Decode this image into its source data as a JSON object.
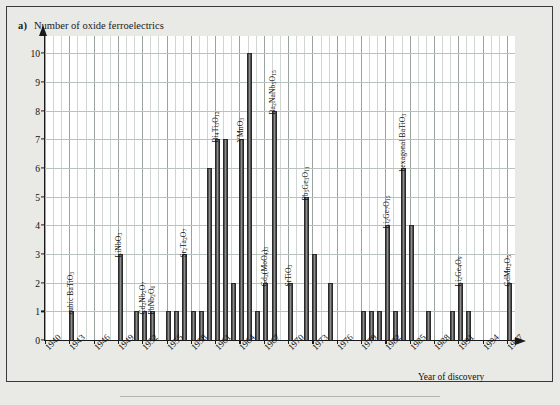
{
  "figure": {
    "panel_label": "a)",
    "y_axis_title": "Number of oxide ferroelectrics",
    "x_axis_title": "Year of discovery",
    "background_color": "#e9e9e5",
    "plot_background_color": "#ffffff",
    "bar_color": "#5a5a5a",
    "grid_color": "#cfd6d2"
  },
  "chart_data": {
    "type": "bar",
    "title": "Number of oxide ferroelectrics",
    "xlabel": "Year of discovery",
    "ylabel": "Number of oxide ferroelectrics",
    "xlim": [
      1940,
      1998
    ],
    "ylim": [
      0,
      10.6
    ],
    "yticks": [
      0,
      1,
      2,
      3,
      4,
      5,
      6,
      7,
      8,
      9,
      10
    ],
    "xticks": [
      1940,
      1943,
      1946,
      1949,
      1952,
      1955,
      1958,
      1961,
      1964,
      1967,
      1970,
      1973,
      1976,
      1979,
      1982,
      1985,
      1988,
      1991,
      1994,
      1997
    ],
    "xtick_labels": [
      "1940",
      "1943",
      "1946",
      "1949",
      "1952",
      "1955",
      "1958",
      "1961",
      "1964",
      "1967",
      "1970",
      "1973",
      "1976",
      "1979",
      "1982",
      "1985",
      "1988",
      "1991",
      "1994",
      "1997"
    ],
    "grid": true,
    "legend": "none",
    "categories": [
      1940,
      1941,
      1942,
      1943,
      1944,
      1945,
      1946,
      1947,
      1948,
      1949,
      1950,
      1951,
      1952,
      1953,
      1954,
      1955,
      1956,
      1957,
      1958,
      1959,
      1960,
      1961,
      1962,
      1963,
      1964,
      1965,
      1966,
      1967,
      1968,
      1969,
      1970,
      1971,
      1972,
      1973,
      1974,
      1975,
      1976,
      1977,
      1978,
      1979,
      1980,
      1981,
      1982,
      1983,
      1984,
      1985,
      1986,
      1987,
      1988,
      1989,
      1990,
      1991,
      1992,
      1993,
      1994,
      1995,
      1996,
      1997
    ],
    "values": [
      0,
      0,
      0,
      1,
      0,
      0,
      0,
      0,
      0,
      3,
      0,
      1,
      1,
      1,
      0,
      1,
      1,
      3,
      1,
      1,
      6,
      7,
      7,
      2,
      7,
      10,
      1,
      2,
      8,
      0,
      2,
      0,
      5,
      3,
      0,
      2,
      0,
      0,
      0,
      1,
      1,
      1,
      4,
      1,
      6,
      4,
      0,
      1,
      0,
      0,
      1,
      2,
      1,
      0,
      0,
      0,
      0,
      2
    ],
    "annotations": [
      {
        "year": 1943,
        "label": "cubic BaTiO3",
        "label_html": "cubic BaTiO<sub>3</sub>",
        "value": 1
      },
      {
        "year": 1949,
        "label": "LiNbO3",
        "label_html": "LiNbO<sub>3</sub>",
        "value": 3
      },
      {
        "year": 1952,
        "label": "Cd2Nb2O7",
        "label_html": "Cd<sub>2</sub>Nb<sub>2</sub>O<sub>7</sub>",
        "value": 1
      },
      {
        "year": 1953,
        "label": "PbNb2O6",
        "label_html": "PbNb<sub>2</sub>O<sub>6</sub>",
        "value": 1
      },
      {
        "year": 1957,
        "label": "Sr2Ta2O7",
        "label_html": "Sr<sub>2</sub>Ta<sub>2</sub>O<sub>7</sub>",
        "value": 3
      },
      {
        "year": 1961,
        "label": "Bi4Ti3O12",
        "label_html": "Bi<sub>4</sub>Ti<sub>3</sub>O<sub>12</sub>",
        "value": 7
      },
      {
        "year": 1964,
        "label": "YMnO3",
        "label_html": "YMnO<sub>3</sub>",
        "value": 7
      },
      {
        "year": 1967,
        "label": "Gd2(MoO4)3",
        "label_html": "Gd<sub>2</sub>(MoO<sub>4</sub>)<sub>3</sub>",
        "value": 2
      },
      {
        "year": 1968,
        "label": "Ba2NaNb5O15",
        "label_html": "Ba<sub>2</sub>NaNb<sub>5</sub>O<sub>15</sub>",
        "value": 8
      },
      {
        "year": 1972,
        "label": "Pb5Ge3O11",
        "label_html": "Pb<sub>5</sub>Ge<sub>3</sub>O<sub>11</sub>",
        "value": 5
      },
      {
        "year": 1970,
        "label": "SrTiO3",
        "label_html": "SrTiO<sub>3</sub>",
        "value": 2
      },
      {
        "year": 1982,
        "label": "Li2Ge7O15",
        "label_html": "Li<sub>2</sub>Ge<sub>7</sub>O<sub>15</sub>",
        "value": 4
      },
      {
        "year": 1984,
        "label": "hexagonal BaTiO3",
        "label_html": "hexagonal BaTiO<sub>3</sub>",
        "value": 6
      },
      {
        "year": 1991,
        "label": "Li2Ge4O9",
        "label_html": "Li<sub>2</sub>Ge<sub>4</sub>O<sub>9</sub>",
        "value": 2
      },
      {
        "year": 1997,
        "label": "GdMn2O5",
        "label_html": "GdMn<sub>2</sub>O<sub>5</sub>",
        "value": 2
      }
    ]
  }
}
